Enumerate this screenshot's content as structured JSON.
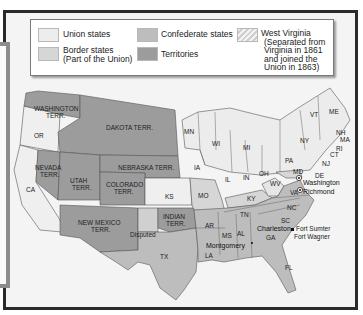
{
  "legend": {
    "items": [
      {
        "label": "Union states",
        "color": "#ededed"
      },
      {
        "label": "Border states (Part of the Union)",
        "color": "#d6d6d6"
      },
      {
        "label": "Confederate states",
        "color": "#bdbdbd"
      },
      {
        "label": "Territories",
        "color": "#9c9c9c"
      },
      {
        "label": "West Virginia (Separated from Virginia in 1861 and joined the Union in 1863)",
        "color": "#e6e6e6",
        "pattern": "hatched"
      }
    ],
    "union": "Union states",
    "border_l1": "Border states",
    "border_l2": "(Part of the Union)",
    "confederate": "Confederate states",
    "territories": "Territories",
    "wv_l1": "West Virginia",
    "wv_l2": "(Separated from",
    "wv_l3": "Virginia in 1861",
    "wv_l4": "and joined the",
    "wv_l5": "Union in 1863)"
  },
  "map": {
    "territories": [
      "WASHINGTON TERR.",
      "DAKOTA TERR.",
      "NEBRASKA TERR.",
      "NEVADA TERR.",
      "UTAH TERR.",
      "COLORADO TERR.",
      "NEW MEXICO TERR.",
      "INDIAN TERR."
    ],
    "union_states": [
      "OR",
      "CA",
      "KS",
      "MN",
      "IA",
      "WI",
      "IL",
      "MI",
      "IN",
      "OH",
      "PA",
      "NY",
      "VT",
      "NH",
      "ME",
      "MA",
      "RI",
      "CT",
      "NJ"
    ],
    "border_states": [
      "MO",
      "KY",
      "MD",
      "DE",
      "WV"
    ],
    "confederate_states": [
      "TX",
      "AR",
      "LA",
      "MS",
      "AL",
      "TN",
      "GA",
      "FL",
      "SC",
      "NC",
      "VA"
    ],
    "other_labels": [
      "Disputed"
    ],
    "cities": [
      "Washington",
      "Richmond",
      "Montgomery",
      "Charleston",
      "Fort Sumter",
      "Fort Wagner"
    ],
    "labels": {
      "wash1": "WASHINGTON",
      "wash2": "TERR.",
      "dakota": "DAKOTA TERR.",
      "nebraska": "NEBRASKA TERR.",
      "nev1": "NEVADA",
      "nev2": "TERR.",
      "utah1": "UTAH",
      "utah2": "TERR.",
      "colo1": "COLORADO",
      "colo2": "TERR.",
      "nm1": "NEW MEXICO",
      "nm2": "TERR.",
      "ind1": "INDIAN",
      "ind2": "TERR.",
      "or": "OR",
      "ca": "CA",
      "ks": "KS",
      "mn": "MN",
      "ia": "IA",
      "wi": "WI",
      "il": "IL",
      "mi": "MI",
      "in": "IN",
      "oh": "OH",
      "pa": "PA",
      "ny": "NY",
      "vt": "VT",
      "nh": "NH",
      "me": "ME",
      "ma": "MA",
      "ri": "RI",
      "ct": "CT",
      "nj": "NJ",
      "mo": "MO",
      "ky": "KY",
      "md": "MD",
      "de": "DE",
      "wv": "WV",
      "tx": "TX",
      "ar": "AR",
      "la": "LA",
      "ms": "MS",
      "al": "AL",
      "tn": "TN",
      "ga": "GA",
      "fl": "FL",
      "sc": "SC",
      "nc": "NC",
      "va": "VA",
      "disputed": "Disputed",
      "washington": "Washington",
      "richmond": "Richmond",
      "montgomery": "Montgomery",
      "charleston": "Charleston",
      "fort_sumter": "Fort Sumter",
      "fort_wagner": "Fort Wagner"
    }
  }
}
